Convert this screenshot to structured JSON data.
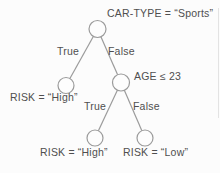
{
  "diagram": {
    "type": "decision-tree",
    "labels": {
      "root_condition": "CAR-TYPE = “Sports”",
      "edge_true_top": "True",
      "edge_false_top": "False",
      "age_condition": "AGE ≤ 23",
      "leaf_risk_high_left": "RISK = “High”",
      "edge_true_bottom": "True",
      "edge_false_bottom": "False",
      "leaf_risk_high_bottom": "RISK = “High”",
      "leaf_risk_low_bottom": "RISK = “Low”"
    },
    "tree": {
      "condition": "CAR-TYPE = “Sports”",
      "true_branch": {
        "result": "RISK = “High”"
      },
      "false_branch": {
        "condition": "AGE ≤ 23",
        "true_branch": {
          "result": "RISK = “High”"
        },
        "false_branch": {
          "result": "RISK = “Low”"
        }
      }
    },
    "colors": {
      "line": "#9b9b9b",
      "text": "#4f4f4f",
      "node_fill": "#fdfdfd",
      "background": "#fcfcfc",
      "artifact": "#d9d9d9"
    }
  }
}
